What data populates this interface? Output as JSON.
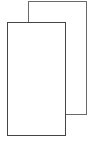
{
  "icon": {
    "name": "copy-icon",
    "stroke_color": "#666666",
    "front_stroke_color": "#444444",
    "fill_color": "#ffffff",
    "stroke_width": "1.5px"
  }
}
